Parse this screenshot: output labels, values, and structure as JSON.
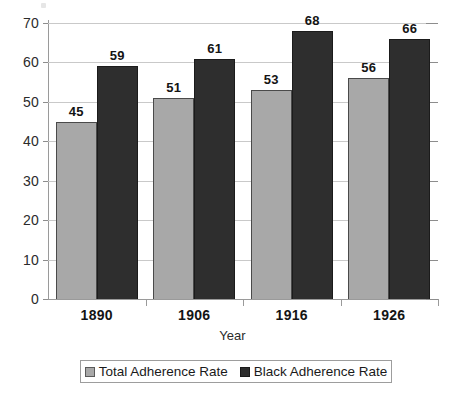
{
  "chart_data": {
    "type": "bar",
    "title": "",
    "subtitle": "",
    "xlabel": "Year",
    "ylabel": "",
    "categories": [
      "1890",
      "1906",
      "1916",
      "1926"
    ],
    "series": [
      {
        "name": "Total Adherence Rate",
        "color": "#a8a8a8",
        "values": [
          45,
          51,
          53,
          56
        ]
      },
      {
        "name": "Black Adherence Rate",
        "color": "#2e2e2e",
        "values": [
          59,
          61,
          68,
          66
        ]
      }
    ],
    "ylim": [
      0,
      70
    ],
    "ytick_step": 10,
    "yticks": [
      0,
      10,
      20,
      30,
      40,
      50,
      60,
      70
    ],
    "ytick_labels": [
      "0",
      "10",
      "20",
      "30",
      "40",
      "50",
      "60",
      "70"
    ],
    "grid": true,
    "grid_axis": "y",
    "data_labels": true,
    "legend": true,
    "legend_position": "bottom",
    "bar_grouping": "grouped",
    "background_color": "#ffffff",
    "gridline_color": "#c9c9c9",
    "axis_color": "#9a9a9a"
  }
}
